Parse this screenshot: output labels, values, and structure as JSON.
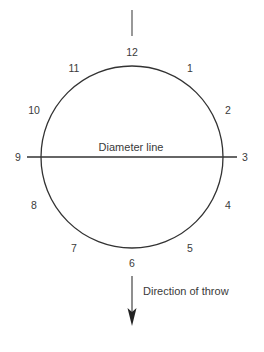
{
  "diagram": {
    "circle": {
      "cx": 132,
      "cy": 157,
      "r": 91,
      "stroke": "#333333"
    },
    "diameter_label": "Diameter line",
    "throw_label": "Direction of throw",
    "clock_positions": [
      {
        "label": "12",
        "x": 132,
        "y": 56
      },
      {
        "label": "1",
        "x": 190,
        "y": 72
      },
      {
        "label": "2",
        "x": 228,
        "y": 114
      },
      {
        "label": "3",
        "x": 245,
        "y": 161
      },
      {
        "label": "4",
        "x": 228,
        "y": 209
      },
      {
        "label": "5",
        "x": 190,
        "y": 252
      },
      {
        "label": "6",
        "x": 132,
        "y": 267
      },
      {
        "label": "7",
        "x": 74,
        "y": 252
      },
      {
        "label": "8",
        "x": 34,
        "y": 209
      },
      {
        "label": "9",
        "x": 18,
        "y": 161
      },
      {
        "label": "10",
        "x": 34,
        "y": 114
      },
      {
        "label": "11",
        "x": 74,
        "y": 72
      }
    ]
  }
}
